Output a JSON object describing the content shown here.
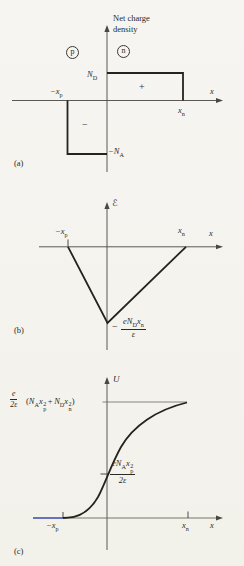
{
  "colors": {
    "ink": "#26231f",
    "axis": "#4a4742",
    "blue": "#4656c8",
    "paper": "#f5f4ef"
  },
  "panel_a": {
    "tag": "(a)",
    "axis_title_line1": "Net charge",
    "axis_title_line2": "density",
    "region_p": "p",
    "region_n": "n",
    "nd_base": "N",
    "nd_sub": "D",
    "na_base": "−N",
    "na_sub": "A",
    "xp_base": "−x",
    "xp_sub": "p",
    "xn_base": "x",
    "xn_sub": "n",
    "x_label": "x",
    "plus_sign": "+",
    "minus_sign": "−"
  },
  "panel_b": {
    "tag": "(b)",
    "y_axis_label": "ℰ",
    "xp_base": "−x",
    "xp_sub": "p",
    "xn_base": "x",
    "xn_sub": "n",
    "x_label": "x",
    "min_minus": "−",
    "min_num_e": "e",
    "min_num_N": "N",
    "min_num_N_sub": "D",
    "min_num_x": "x",
    "min_num_x_sub": "n",
    "min_den": "ε"
  },
  "panel_c": {
    "tag": "(c)",
    "y_axis_label": "U",
    "max_num": "e",
    "max_den": "2ε",
    "max_open": "(",
    "max_N1": "N",
    "max_N1_sub": "A",
    "max_x1": "x",
    "max_x1_sup": "2",
    "max_x1_sub": "p",
    "max_plus": "+",
    "max_N2": "N",
    "max_N2_sub": "D",
    "max_x2": "x",
    "max_x2_sup": "2",
    "max_x2_sub": "n",
    "max_close": ")",
    "mid_num_e": "e",
    "mid_num_N": "N",
    "mid_num_N_sub": "A",
    "mid_num_x": "x",
    "mid_num_x_sup": "2",
    "mid_num_x_sub": "p",
    "mid_den": "2ε",
    "xp_base": "−x",
    "xp_sub": "p",
    "xn_base": "x",
    "xn_sub": "n",
    "x_label": "x"
  }
}
